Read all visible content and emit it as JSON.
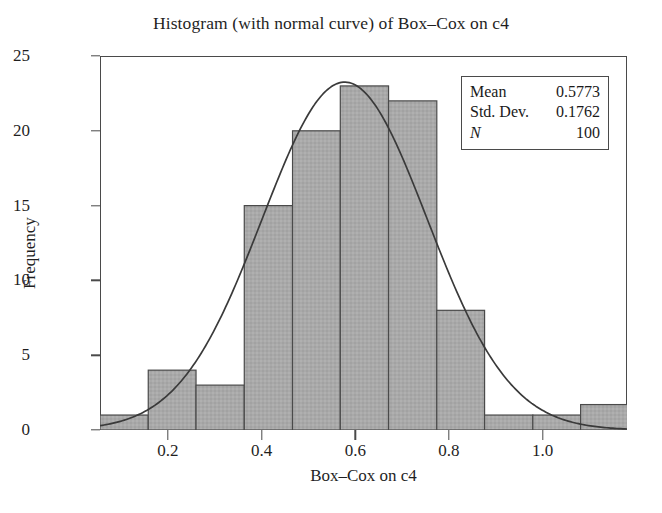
{
  "chart_data": {
    "type": "bar",
    "title": "Histogram (with normal curve) of Box–Cox on c4",
    "xlabel": "Box–Cox on c4",
    "ylabel": "Frequency",
    "xlim": [
      0.055,
      1.18
    ],
    "ylim": [
      0,
      25
    ],
    "grid": false,
    "legend_position": "top-right",
    "bin_width": 0.1027,
    "bin_edges": [
      0.055,
      0.158,
      0.26,
      0.363,
      0.466,
      0.568,
      0.671,
      0.774,
      0.876,
      0.979,
      1.081,
      1.184
    ],
    "bin_centers": [
      0.107,
      0.209,
      0.312,
      0.414,
      0.517,
      0.62,
      0.722,
      0.825,
      0.928,
      1.03,
      1.133
    ],
    "categories": [
      "0.11",
      "0.21",
      "0.31",
      "0.41",
      "0.52",
      "0.62",
      "0.72",
      "0.82",
      "0.93",
      "1.03",
      "1.13"
    ],
    "values": [
      1,
      4,
      3,
      15,
      20,
      23,
      22,
      8,
      1,
      1,
      1.7
    ],
    "ytick_values": [
      0,
      5,
      10,
      15,
      20,
      25
    ],
    "ytick_labels": [
      "0",
      "5",
      "10",
      "15",
      "20",
      "25"
    ],
    "xtick_values": [
      0.2,
      0.4,
      0.6,
      0.8,
      1.0
    ],
    "xtick_labels": [
      "0.2",
      "0.4",
      "0.6",
      "0.8",
      "1.0"
    ],
    "overlay_curve": {
      "name": "normal curve",
      "mean": 0.5773,
      "std_dev": 0.1762,
      "n": 100,
      "scale_note": "N * bin_width * normal pdf"
    },
    "bar_fill_color": "#a9a9a9",
    "bar_edge_color": "#4a4a4a",
    "curve_color": "#3a3a3a",
    "axis_color": "#4a4a4a",
    "background_color": "#ffffff"
  },
  "stats_box": {
    "rows": [
      {
        "key": "Mean",
        "value": "0.5773"
      },
      {
        "key": "Std. Dev.",
        "value": "0.1762"
      },
      {
        "key": "N",
        "value": "100"
      }
    ]
  }
}
